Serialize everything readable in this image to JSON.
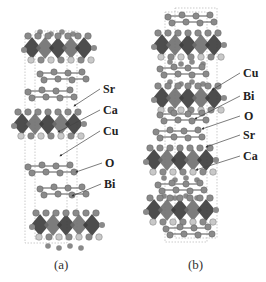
{
  "figure": {
    "panels": [
      {
        "id": "a",
        "caption": "(a)",
        "labels": [
          "Sr",
          "Ca",
          "Cu",
          "O",
          "Bi"
        ]
      },
      {
        "id": "b",
        "caption": "(b)",
        "labels": [
          "Cu",
          "Bi",
          "O",
          "Sr",
          "Ca"
        ]
      }
    ],
    "colors": {
      "perovskite_dark": "#3a3a3a",
      "perovskite_mid": "#6e6e6e",
      "atom": "#8a8a8a",
      "atom_light": "#c8c8c8",
      "cell_line": "#aaaaaa",
      "text": "#222222"
    }
  }
}
